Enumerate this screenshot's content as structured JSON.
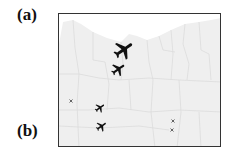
{
  "panels": {
    "a": {
      "label": "(a)"
    },
    "b": {
      "label": "(b)"
    }
  },
  "map": {
    "region": "Oregon",
    "land_color": "#efefef",
    "border_color": "#dcdcdc",
    "frame_color": "#333333",
    "markers": [
      {
        "type": "airplane-icon",
        "x": 123,
        "y": 49,
        "size": 24,
        "color": "#111111"
      },
      {
        "type": "airplane-icon",
        "x": 117,
        "y": 68,
        "size": 17,
        "color": "#111111"
      },
      {
        "type": "airplane-icon",
        "x": 99,
        "y": 107,
        "size": 12,
        "color": "#111111"
      },
      {
        "type": "airplane-icon",
        "x": 100,
        "y": 125,
        "size": 13,
        "color": "#111111"
      },
      {
        "type": "small-x-marker",
        "x": 70,
        "y": 100,
        "size": 4,
        "color": "#555555"
      },
      {
        "type": "small-x-marker",
        "x": 172,
        "y": 120,
        "size": 4,
        "color": "#555555"
      },
      {
        "type": "small-x-marker",
        "x": 171,
        "y": 129,
        "size": 4,
        "color": "#555555"
      }
    ]
  }
}
